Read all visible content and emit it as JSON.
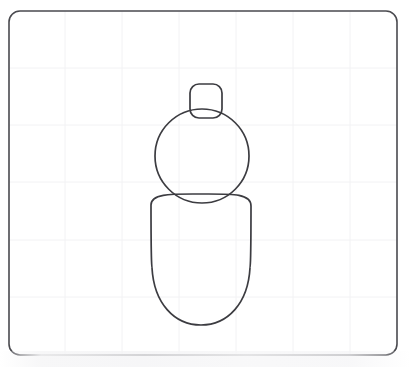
{
  "canvas": {
    "width": 411,
    "height": 367,
    "background_color": "#ffffff",
    "border": {
      "color": "#4a4a4f",
      "width": 1.6,
      "corner_radius": 11,
      "x": 9,
      "y": 11,
      "w": 388,
      "h": 344
    },
    "grid": {
      "visible": true,
      "color": "#f2f2f4",
      "line_width": 1,
      "spacing": 57,
      "vertical_lines": [
        65,
        122,
        179,
        236,
        293,
        350
      ],
      "horizontal_lines": [
        68,
        125,
        182,
        240,
        297
      ]
    }
  },
  "drawing": {
    "title": "snowman-figure",
    "stroke_color": "#3c3c41",
    "stroke_width": 1.7,
    "fill": "none",
    "shapes": [
      {
        "name": "hat",
        "type": "rounded-rect",
        "x": 190,
        "y": 84,
        "width": 32,
        "height": 34,
        "corner_radius": 9
      },
      {
        "name": "head",
        "type": "ellipse",
        "cx": 202,
        "cy": 156,
        "rx": 47,
        "ry": 47
      },
      {
        "name": "body",
        "type": "egg",
        "cx": 201,
        "cy": 259,
        "rx": 50,
        "top_y": 194,
        "bottom_y": 325
      }
    ]
  },
  "chart_data": {
    "type": "scatter",
    "xlabel": "",
    "ylabel": "",
    "grid": true,
    "legend_position": "none",
    "xlim": [
      9,
      397
    ],
    "ylim": [
      11,
      355
    ],
    "annotations": [
      "rounded square hat at top",
      "circular head in middle",
      "egg-shaped body at bottom"
    ]
  }
}
